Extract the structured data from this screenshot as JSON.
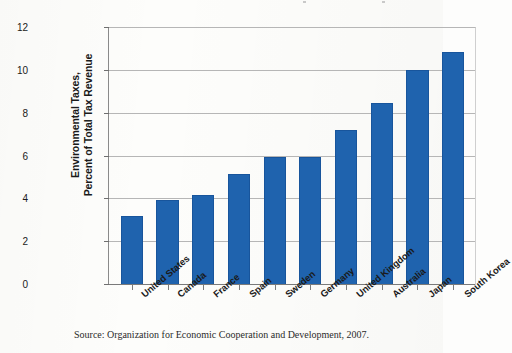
{
  "chart_data": {
    "type": "bar",
    "title": "",
    "xlabel": "",
    "ylabel": "Environmental Taxes,\nPercent of Total Tax Revenue",
    "categories": [
      "United States",
      "Canada",
      "France",
      "Spain",
      "Sweden",
      "Germany",
      "United Kingdom",
      "Australia",
      "Japan",
      "South Korea"
    ],
    "values": [
      3.2,
      3.95,
      4.2,
      5.2,
      6.0,
      6.0,
      7.25,
      8.5,
      10.05,
      10.9
    ],
    "ylim": [
      0,
      12
    ],
    "yticks": [
      0,
      2,
      4,
      6,
      8,
      10,
      12
    ],
    "ytick_labels": [
      "0",
      "2",
      "4",
      "6",
      "8",
      "10",
      "12"
    ],
    "grid": true,
    "legend": "none",
    "series_name": "Environmental Taxes",
    "bar_color": "#1f63ae",
    "gridline_color": "#b6b6b6",
    "axis_color": "#7a7a7a"
  },
  "footer": {
    "source_note": "Source: Organization for Economic Cooperation and Development, 2007."
  }
}
